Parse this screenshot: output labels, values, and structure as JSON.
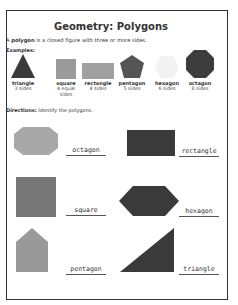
{
  "worksheet": {
    "title": "Geometry: Polygons",
    "definition": {
      "prefix": "A ",
      "term": "polygon",
      "suffix": " is a closed figure with three or more sides."
    },
    "examples_label": "Examples:",
    "examples": [
      {
        "name": "triangle",
        "desc": "3 sides",
        "color": "#3a3a3a"
      },
      {
        "name": "square",
        "desc": "4 equal sides",
        "color": "#9a9a9a"
      },
      {
        "name": "rectangle",
        "desc": "4 sides",
        "color": "#a0a0a0"
      },
      {
        "name": "pentagon",
        "desc": "5 sides",
        "color": "#555555"
      },
      {
        "name": "hexagon",
        "desc": "6 sides",
        "color": "#f2f2f2"
      },
      {
        "name": "octagon",
        "desc": "8 sides",
        "color": "#3c3c3c"
      }
    ],
    "directions": {
      "label": "Directions:",
      "text": " Identify the polygons."
    },
    "problems": [
      {
        "shape": "octagon",
        "answer": "octagon",
        "color": "#a8a8a8"
      },
      {
        "shape": "rectangle",
        "answer": "rectangle",
        "color": "#3a3a3a"
      },
      {
        "shape": "square",
        "answer": "square",
        "color": "#777777"
      },
      {
        "shape": "hexagon",
        "answer": "hexagon",
        "color": "#3a3a3a"
      },
      {
        "shape": "pentagon",
        "answer": "pentagon",
        "color": "#999999"
      },
      {
        "shape": "triangle",
        "answer": "triangle",
        "color": "#3a3a3a"
      }
    ]
  }
}
